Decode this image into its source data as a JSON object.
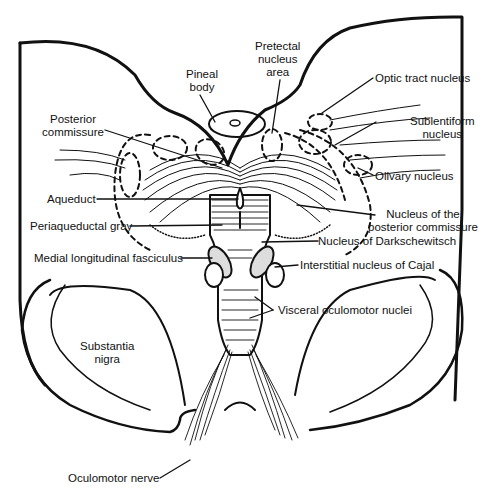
{
  "diagram": {
    "labels": {
      "pineal_body": [
        "Pineal",
        "body"
      ],
      "pretectal": [
        "Pretectal",
        "nucleus",
        "area"
      ],
      "optic_tract_nucleus": "Optic tract nucleus",
      "posterior_commissure": [
        "Posterior",
        "commissure"
      ],
      "sublentiform": [
        "Sublentiform",
        "nucleus"
      ],
      "olivary": "Olivary nucleus",
      "aqueduct": "Aqueduct",
      "nucleus_posterior_commissure": [
        "Nucleus of the",
        "posterior commissure"
      ],
      "periaqueductal_gray": "Periaqueductal gray",
      "darkschewitsch": "Nucleus of Darkschewitsch",
      "mlf": "Medial longitudinal fasciculus",
      "cajal": "Interstitial nucleus of Cajal",
      "visceral_oculomotor": "Visceral oculomotor nuclei",
      "substantia_nigra": [
        "Substantia",
        "nigra"
      ],
      "oculomotor_nerve": "Oculomotor nerve"
    },
    "colors": {
      "ink": "#111111",
      "background": "#ffffff"
    }
  }
}
